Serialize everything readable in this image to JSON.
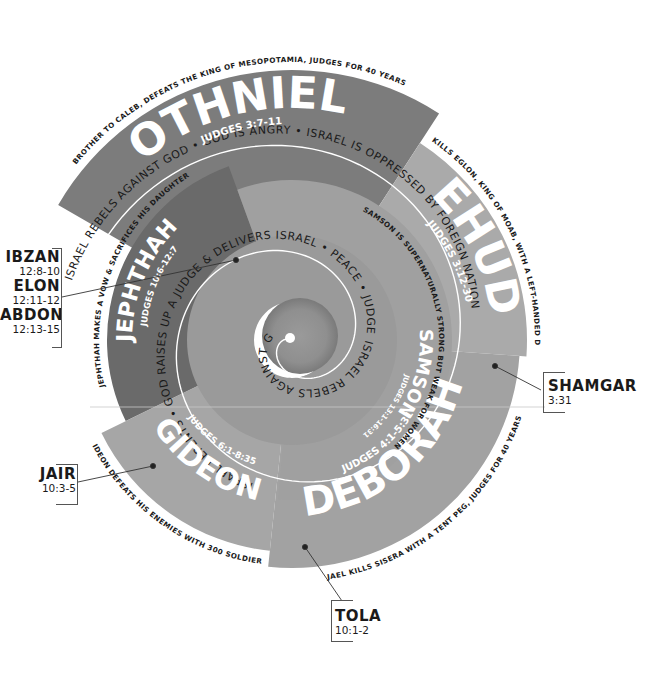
{
  "diagram": {
    "center": [
      292,
      340
    ],
    "colors": {
      "othniel": "#7c7c7c",
      "ehud": "#aaaaaa",
      "deborah": "#a2a2a2",
      "gideon": "#a6a6a6",
      "jephthah": "#6a6a6a",
      "samson_ring": "#a0a0a0",
      "inner_ring": "#9a9a9a",
      "spiral_line": "#ffffff",
      "text_dark": "#1a1a1a",
      "text_light": "#ffffff",
      "leader_line": "#333333"
    },
    "segments": [
      {
        "id": "othniel",
        "name": "OTHNIEL",
        "reference": "JUDGES 3:7-11",
        "caption": "BROTHER TO CALEB, DEFEATS THE KING OF MESOPOTAMIA, JUDGES FOR 40 YEARS",
        "start_angle": -150,
        "end_angle": -57,
        "outer_radius": 270,
        "inner_radius": 170
      },
      {
        "id": "ehud",
        "name": "EHUD",
        "reference": "JUDGES 3:12-30",
        "caption": "EHUD KILLS EGLON, KING OF MOAB, WITH A LEFT-HANDED DAGGER",
        "start_angle": -57,
        "end_angle": 4,
        "outer_radius": 235,
        "inner_radius": 150
      },
      {
        "id": "deborah",
        "name": "DEBORAH",
        "reference": "JUDGES 4:1-5:31",
        "caption": "JAEL KILLS SISERA WITH A TENT PEG, JUDGES FOR 40 YEARS",
        "start_angle": 4,
        "end_angle": 96,
        "outer_radius": 228,
        "inner_radius": 145
      },
      {
        "id": "gideon",
        "name": "GIDEON",
        "reference": "JUDGES 6:1-8:35",
        "caption": "GIDEON DEFEATS HIS ENEMIES WITH 300 SOLDIERS",
        "start_angle": 96,
        "end_angle": 154,
        "outer_radius": 212,
        "inner_radius": 140
      },
      {
        "id": "jephthah",
        "name": "JEPHTHAH",
        "reference": "JUDGES 10:6-12:7",
        "caption": "JEPHTHAH MAKES A VOW & SACRIFICES HIS DAUGHTER",
        "start_angle": 154,
        "end_angle": 250,
        "outer_radius": 185,
        "inner_radius": 128
      },
      {
        "id": "samson",
        "name": "SAMSON",
        "reference": "JUDGES 13:1-16:31",
        "caption": "SAMSON IS SUPERNATURALLY STRONG BUT WEAK FOR WOMEN",
        "start_angle": 250,
        "end_angle": 455,
        "outer_radius": 160,
        "inner_radius": 100
      }
    ],
    "cycle_text": "ISRAEL REBELS AGAINST GOD • GOD IS ANGRY • ISRAEL IS OPPRESSED BY FOREIGN NATION • ISRAEL REPENTS • GOD RAISES UP A JUDGE & DELIVERS ISRAEL • PEACE • JUDGE DIES • ISRAEL REBELS AGAINST GOD",
    "minor_judges": [
      {
        "name": "IBZAN",
        "reference": "12:8-10"
      },
      {
        "name": "ELON",
        "reference": "12:11-12"
      },
      {
        "name": "ABDON",
        "reference": "12:13-15"
      },
      {
        "name": "SHAMGAR",
        "reference": "3:31"
      },
      {
        "name": "JAIR",
        "reference": "10:3-5"
      },
      {
        "name": "TOLA",
        "reference": "10:1-2"
      }
    ]
  }
}
